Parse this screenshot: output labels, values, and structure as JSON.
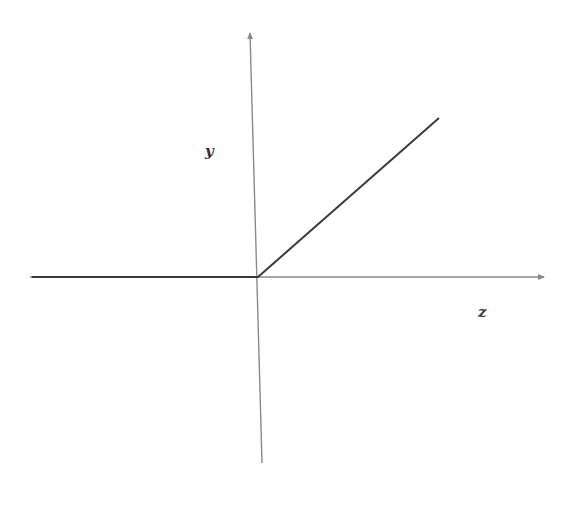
{
  "chart_data": {
    "type": "line",
    "title": "",
    "xlabel": "z",
    "ylabel": "y",
    "grid": false,
    "legend": null,
    "series": [
      {
        "name": "ReLU",
        "x": [
          -1.25,
          0,
          1.0
        ],
        "y": [
          0,
          0,
          1.0
        ]
      }
    ],
    "xlim": [
      -1.25,
      1.6
    ],
    "ylim": [
      -1.05,
      1.3
    ]
  },
  "labels": {
    "y_axis": "y",
    "x_axis": "z"
  },
  "colors": {
    "axis": "#8a8a8a",
    "curve": "#3a3a3a",
    "label": "#333333"
  }
}
